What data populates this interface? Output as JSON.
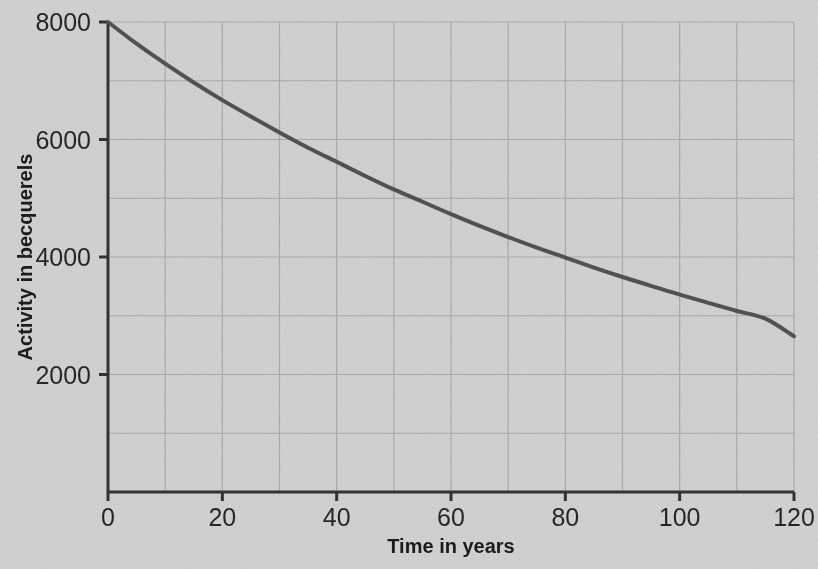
{
  "chart_data": {
    "type": "line",
    "title": "",
    "xlabel": "Time in years",
    "ylabel": "Activity in becquerels",
    "xlim": [
      0,
      120
    ],
    "ylim": [
      0,
      8000
    ],
    "xticks": [
      0,
      20,
      40,
      60,
      80,
      100,
      120
    ],
    "xtick_labels": [
      "0",
      "20",
      "40",
      "60",
      "80",
      "100",
      "120"
    ],
    "yticks": [
      2000,
      4000,
      6000,
      8000
    ],
    "ytick_labels": [
      "2000",
      "4000",
      "6000",
      "8000"
    ],
    "grid": true,
    "grid_x_step": 10,
    "grid_y_step": 1000,
    "legend": "none",
    "series": [
      {
        "name": "Activity",
        "color": "#4b4b4b",
        "line_width": 4,
        "x": [
          0,
          5,
          10,
          15,
          20,
          25,
          30,
          35,
          40,
          45,
          50,
          55,
          60,
          65,
          70,
          75,
          80,
          85,
          90,
          95,
          100,
          105,
          110,
          115,
          120
        ],
        "y": [
          8000,
          7630,
          7290,
          6970,
          6670,
          6390,
          6120,
          5860,
          5620,
          5380,
          5150,
          4940,
          4730,
          4530,
          4340,
          4160,
          3990,
          3820,
          3660,
          3510,
          3360,
          3220,
          3080,
          2950,
          2650
        ]
      }
    ]
  },
  "colors": {
    "background": "#d3d3d3",
    "grid": "#a9a9a9",
    "axis": "#2a2a2a",
    "curve": "#4b4b4b",
    "text": "#141414"
  }
}
